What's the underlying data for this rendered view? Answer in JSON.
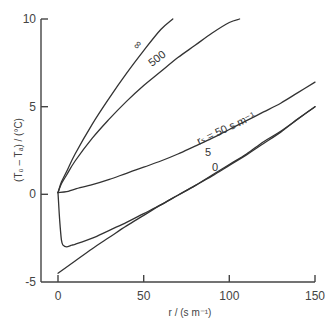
{
  "chart_data": {
    "type": "line",
    "title": "",
    "xlabel": "r / (s m⁻¹)",
    "ylabel": "(T₀ – Tₐ) / (°C)",
    "xlim": [
      0,
      150
    ],
    "ylim": [
      -5,
      10
    ],
    "xticks": [
      0,
      50,
      100,
      150
    ],
    "yticks": [
      -5,
      0,
      5,
      10
    ],
    "xtick_labels": [
      "0",
      "50",
      "100",
      "150"
    ],
    "ytick_labels": [
      "-5",
      "0",
      "5",
      "10"
    ],
    "grid": false,
    "legend": "none (curves labelled inline)",
    "series": [
      {
        "name": "∞",
        "label": "∞",
        "x": [
          0,
          2,
          5,
          10,
          20,
          30,
          40,
          50,
          60,
          67
        ],
        "y": [
          0.1,
          0.7,
          1.3,
          2.3,
          4.0,
          5.5,
          6.9,
          8.2,
          9.4,
          10.0
        ]
      },
      {
        "name": "500",
        "label": "500",
        "x": [
          0,
          2,
          5,
          10,
          20,
          30,
          40,
          50,
          60,
          70,
          80,
          90,
          100,
          106
        ],
        "y": [
          0.1,
          0.6,
          1.1,
          1.9,
          3.2,
          4.3,
          5.3,
          6.2,
          7.0,
          7.8,
          8.5,
          9.2,
          9.8,
          10.0
        ]
      },
      {
        "name": "r_s = 50 s m⁻¹",
        "label": "rₛ = 50 s m⁻¹",
        "x": [
          0,
          5,
          10,
          20,
          30,
          40,
          50,
          60,
          70,
          80,
          90,
          100,
          110,
          120,
          130,
          140,
          150
        ],
        "y": [
          0.1,
          0.15,
          0.3,
          0.55,
          0.85,
          1.2,
          1.55,
          1.9,
          2.3,
          2.75,
          3.2,
          3.7,
          4.2,
          4.7,
          5.2,
          5.8,
          6.4
        ]
      },
      {
        "name": "5",
        "label": "5",
        "x": [
          0,
          1,
          2,
          3,
          5,
          8,
          10,
          20,
          30,
          40,
          50,
          60,
          70,
          80,
          90,
          100,
          110,
          120,
          130,
          140,
          150
        ],
        "y": [
          0.1,
          -1.5,
          -2.6,
          -2.9,
          -3.0,
          -2.9,
          -2.85,
          -2.5,
          -2.05,
          -1.6,
          -1.1,
          -0.6,
          -0.05,
          0.5,
          1.1,
          1.7,
          2.3,
          3.0,
          3.6,
          4.3,
          5.0
        ]
      },
      {
        "name": "0",
        "label": "0",
        "x": [
          0,
          10,
          20,
          30,
          40,
          50,
          60,
          70,
          80,
          90,
          100,
          110,
          120,
          130,
          140,
          150
        ],
        "y": [
          -4.5,
          -3.8,
          -3.1,
          -2.45,
          -1.8,
          -1.2,
          -0.6,
          -0.05,
          0.5,
          1.05,
          1.65,
          2.25,
          2.9,
          3.55,
          4.3,
          5.0
        ]
      }
    ],
    "annotations": [
      "∞",
      "500",
      "rₛ = 50 s m⁻¹",
      "5",
      "0"
    ]
  },
  "axes": {
    "x_title": "r / (s m⁻¹)",
    "y_title": "(T₀ – Tₐ) / (°C)",
    "x_ticks": [
      "0",
      "50",
      "100",
      "150"
    ],
    "y_ticks": [
      "10",
      "5",
      "0",
      "-5"
    ]
  },
  "labels": {
    "infinity": "∞",
    "r500": "500",
    "rs50": "rₛ = 50 s m⁻¹",
    "r5": "5",
    "r0": "0"
  },
  "style": {
    "line_color": "#333333",
    "axis_color": "#444444"
  }
}
